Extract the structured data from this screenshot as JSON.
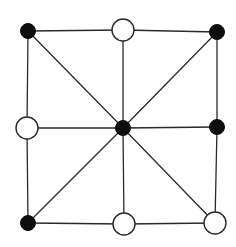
{
  "diagram": {
    "type": "three-mens-morris-board",
    "colors": {
      "background": "#ffffff",
      "line": "#2a2a2a",
      "black_piece": "#0d0d0d",
      "white_piece": "#ffffff"
    },
    "nodes": [
      {
        "id": "top-left",
        "x": 28,
        "y": 31,
        "piece": "black"
      },
      {
        "id": "top-middle",
        "x": 123,
        "y": 30,
        "piece": "white"
      },
      {
        "id": "top-right",
        "x": 217,
        "y": 32,
        "piece": "black"
      },
      {
        "id": "middle-left",
        "x": 27,
        "y": 128,
        "piece": "white"
      },
      {
        "id": "center",
        "x": 123,
        "y": 128,
        "piece": "black"
      },
      {
        "id": "middle-right",
        "x": 217,
        "y": 127,
        "piece": "black"
      },
      {
        "id": "bottom-left",
        "x": 28,
        "y": 223,
        "piece": "black"
      },
      {
        "id": "bottom-middle",
        "x": 124,
        "y": 224,
        "piece": "white"
      },
      {
        "id": "bottom-right",
        "x": 215,
        "y": 223,
        "piece": "white"
      }
    ],
    "edges": [
      [
        "top-left",
        "top-middle"
      ],
      [
        "top-middle",
        "top-right"
      ],
      [
        "middle-left",
        "center"
      ],
      [
        "center",
        "middle-right"
      ],
      [
        "bottom-left",
        "bottom-middle"
      ],
      [
        "bottom-middle",
        "bottom-right"
      ],
      [
        "top-left",
        "middle-left"
      ],
      [
        "middle-left",
        "bottom-left"
      ],
      [
        "top-middle",
        "center"
      ],
      [
        "center",
        "bottom-middle"
      ],
      [
        "top-right",
        "middle-right"
      ],
      [
        "middle-right",
        "bottom-right"
      ],
      [
        "top-left",
        "center"
      ],
      [
        "center",
        "bottom-right"
      ],
      [
        "top-right",
        "center"
      ],
      [
        "center",
        "bottom-left"
      ]
    ],
    "piece_counts": {
      "black": 5,
      "white": 4
    }
  }
}
